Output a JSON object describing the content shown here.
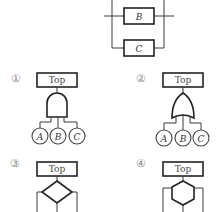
{
  "reliability_block": {
    "blocks": [
      {
        "id": "B",
        "label": "B"
      },
      {
        "id": "C",
        "label": "C"
      }
    ]
  },
  "options": [
    {
      "number": "①",
      "top_label": "Top",
      "gate": "and-gate",
      "events": [
        "A",
        "B",
        "C"
      ]
    },
    {
      "number": "②",
      "top_label": "Top",
      "gate": "or-gate",
      "events": [
        "A",
        "B",
        "C"
      ]
    },
    {
      "number": "③",
      "top_label": "Top",
      "gate": "diamond-gate"
    },
    {
      "number": "④",
      "top_label": "Top",
      "gate": "hexagon-gate"
    }
  ]
}
